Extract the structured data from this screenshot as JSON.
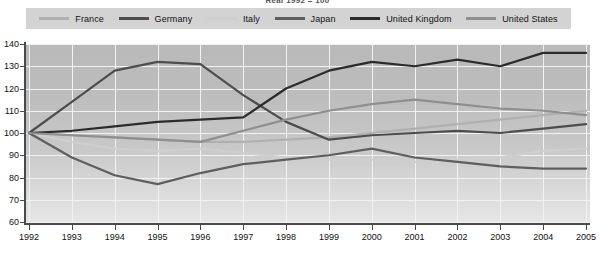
{
  "chart": {
    "title": "Real 1992 = 100",
    "axis": {
      "y_ticks": [
        140,
        130,
        120,
        110,
        100,
        90,
        80,
        70,
        60
      ],
      "x_ticks": [
        "1992",
        "1993",
        "1994",
        "1995",
        "1996",
        "1997",
        "1998",
        "1999",
        "2000",
        "2001",
        "2002",
        "2003",
        "2004",
        "2005"
      ]
    }
  },
  "legend": {
    "items": [
      {
        "label": "France",
        "color": "#b0b0b0"
      },
      {
        "label": "Germany",
        "color": "#4d4d4d"
      },
      {
        "label": "Italy",
        "color": "#cfcfcf"
      },
      {
        "label": "Japan",
        "color": "#5e5e5e"
      },
      {
        "label": "United Kingdom",
        "color": "#2b2b2b"
      },
      {
        "label": "United States",
        "color": "#8f8f8f"
      }
    ]
  },
  "chart_data": {
    "type": "line",
    "title": "Real 1992 = 100",
    "xlabel": "",
    "ylabel": "",
    "ylim": [
      60,
      140
    ],
    "grid": true,
    "legend_position": "top",
    "x": [
      1992,
      1993,
      1994,
      1995,
      1996,
      1997,
      1998,
      1999,
      2000,
      2001,
      2002,
      2003,
      2004,
      2005
    ],
    "categories": [
      "1992",
      "1993",
      "1994",
      "1995",
      "1996",
      "1997",
      "1998",
      "1999",
      "2000",
      "2001",
      "2002",
      "2003",
      "2004",
      "2005"
    ],
    "series": [
      {
        "name": "France",
        "color": "#b0b0b0",
        "values": [
          100,
          99,
          98,
          97,
          96,
          96,
          97,
          98,
          100,
          102,
          104,
          106,
          108,
          110
        ]
      },
      {
        "name": "Germany",
        "color": "#4d4d4d",
        "values": [
          100,
          114,
          128,
          132,
          131,
          117,
          105,
          97,
          99,
          100,
          101,
          100,
          102,
          104
        ]
      },
      {
        "name": "Italy",
        "color": "#cfcfcf",
        "values": [
          100,
          96,
          93,
          92,
          93,
          91,
          89,
          88,
          88,
          87,
          88,
          89,
          92,
          93
        ]
      },
      {
        "name": "Japan",
        "color": "#5e5e5e",
        "values": [
          100,
          89,
          81,
          77,
          82,
          86,
          88,
          90,
          93,
          89,
          87,
          85,
          84,
          84
        ]
      },
      {
        "name": "United Kingdom",
        "color": "#2b2b2b",
        "values": [
          100,
          101,
          103,
          105,
          106,
          107,
          120,
          128,
          132,
          130,
          133,
          130,
          136,
          136
        ]
      },
      {
        "name": "United States",
        "color": "#8f8f8f",
        "values": [
          100,
          99,
          98,
          97,
          96,
          101,
          106,
          110,
          113,
          115,
          113,
          111,
          110,
          108
        ]
      }
    ]
  }
}
